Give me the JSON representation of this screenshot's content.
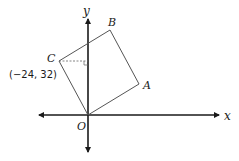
{
  "diagram": {
    "type": "coordinate-geometry",
    "axes": {
      "x_label": "x",
      "y_label": "y",
      "origin_label": "O"
    },
    "square": {
      "vertices": [
        {
          "name": "O",
          "label": "O"
        },
        {
          "name": "A",
          "label": "A"
        },
        {
          "name": "B",
          "label": "B"
        },
        {
          "name": "C",
          "label": "C"
        }
      ]
    },
    "annotations": {
      "point_c_coordinates": "(−24, 32)"
    },
    "colors": {
      "axis": "#1a1a1a",
      "shape": "#555555",
      "dashed": "#666666"
    }
  }
}
